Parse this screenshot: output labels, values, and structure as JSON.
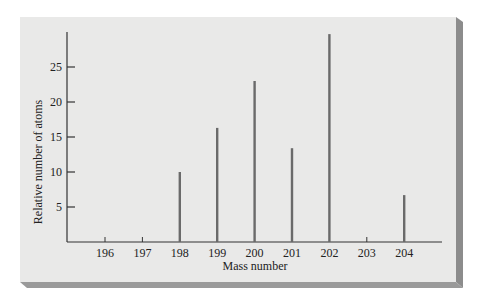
{
  "chart_data": {
    "type": "bar",
    "title": "",
    "xlabel": "Mass number",
    "ylabel": "Relative number of atoms",
    "categories": [
      "196",
      "197",
      "198",
      "199",
      "200",
      "201",
      "202",
      "203",
      "204"
    ],
    "values": [
      0.15,
      0.1,
      10.0,
      16.3,
      23.0,
      13.4,
      29.7,
      0,
      6.7
    ],
    "yticks": [
      "5",
      "10",
      "15",
      "20",
      "25"
    ],
    "ytick_values": [
      5,
      10,
      15,
      20,
      25
    ],
    "ylim": [
      0,
      30
    ],
    "grid": false,
    "legend": null
  },
  "colors": {
    "panel_bg": "#e9e9e8",
    "panel_shadow": "#8c8c8c",
    "bar": "#6a6a6a",
    "axis": "#333333"
  }
}
